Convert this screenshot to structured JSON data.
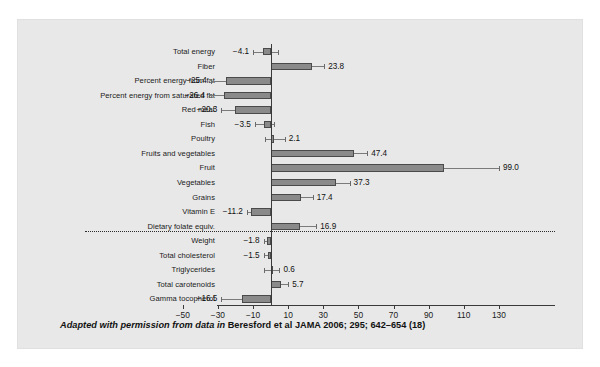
{
  "caption": {
    "lead": "Adapted with permission from data in ",
    "source": "Beresford et al  JAMA 2006; 295; 642–654 (18)"
  },
  "colors": {
    "panel_background": "#e8e8e8",
    "bar_fill": "#8a8a8a",
    "bar_edge": "#4a4a4a",
    "axis": "#3a3a3a",
    "divider": "#2b2b2b",
    "text": "#1a1a1a"
  },
  "chart_data": {
    "type": "bar",
    "orientation": "horizontal",
    "title": "",
    "xlabel": "",
    "ylabel": "",
    "xlim": [
      -50,
      130
    ],
    "xticks": [
      -50,
      -30,
      -10,
      10,
      30,
      50,
      70,
      90,
      110,
      130
    ],
    "xticklabels": [
      "−50",
      "−30",
      "−10",
      "10",
      "30",
      "50",
      "70",
      "90",
      "110",
      "130"
    ],
    "grid": false,
    "legend": "none",
    "zero_reference_line": 0,
    "group_divider_after": "Dietary folate equiv.",
    "categories": [
      "Total energy",
      "Fiber",
      "Percent energy from fat",
      "Percent energy from saturated fat",
      "Red meat",
      "Fish",
      "Poultry",
      "Fruits and vegetables",
      "Fruit",
      "Vegetables",
      "Grains",
      "Vitamin E",
      "Dietary folate equiv.",
      "Weight",
      "Total cholesterol",
      "Triglycerides",
      "Total carotenoids",
      "Gamma tocopherol"
    ],
    "values": [
      -4.1,
      23.8,
      -25.4,
      -26.4,
      -20.3,
      -3.5,
      2.1,
      47.4,
      99.0,
      37.3,
      17.4,
      -11.2,
      16.9,
      -1.8,
      -1.5,
      0.6,
      5.7,
      -16.5
    ],
    "value_labels": [
      "−4.1",
      "23.8",
      "−25.4",
      "−26.4",
      "−20.3",
      "−3.5",
      "2.1",
      "47.4",
      "99.0",
      "37.3",
      "17.4",
      "−11.2",
      "16.9",
      "−1.8",
      "−1.5",
      "0.6",
      "5.7",
      "−16.5"
    ],
    "error_high": [
      4.0,
      30.5,
      -23.0,
      -24.0,
      -13.0,
      2.0,
      8.0,
      55.0,
      130.0,
      45.0,
      24.0,
      -9.0,
      26.0,
      0.5,
      0.5,
      5.0,
      10.0,
      -12.5
    ],
    "error_low": [
      -10.0,
      17.0,
      -34.0,
      -35.0,
      -28.0,
      -9.0,
      -3.0,
      40.0,
      72.0,
      30.0,
      11.0,
      -13.5,
      8.0,
      -4.0,
      -4.0,
      -4.0,
      1.0,
      -28.0
    ]
  }
}
